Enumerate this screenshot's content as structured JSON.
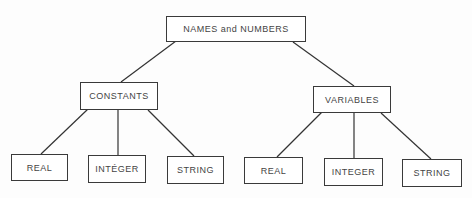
{
  "diagram": {
    "type": "tree",
    "root": {
      "label": "NAMES and NUMBERS"
    },
    "categories": [
      {
        "label": "CONSTANTS",
        "children": [
          "REAL",
          "INTÉGER",
          "STRING"
        ]
      },
      {
        "label": "VARIABLES",
        "children": [
          "REAL",
          "INTEGER",
          "STRING"
        ]
      }
    ],
    "colors": {
      "line": "#333333",
      "border": "#3a3a3a",
      "text": "#444444",
      "background": "#ffffff"
    }
  }
}
